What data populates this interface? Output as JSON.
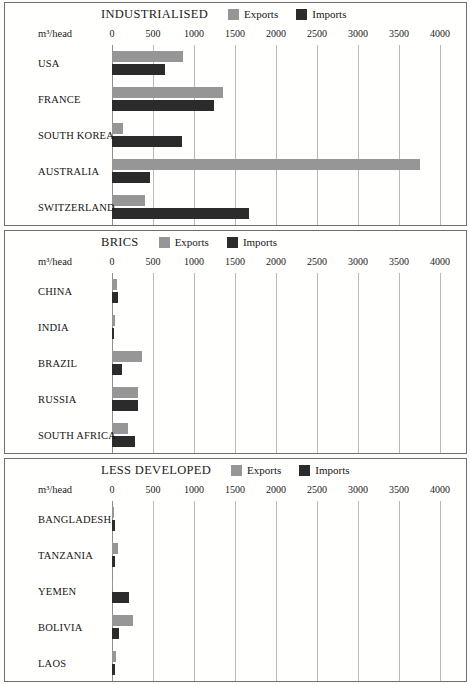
{
  "figure": {
    "unit_label": "m³/head",
    "axis_min": 0,
    "axis_max": 4000,
    "ticks": [
      0,
      500,
      1000,
      1500,
      2000,
      2500,
      3000,
      3500,
      4000
    ],
    "tick_labels": [
      "0",
      "500",
      "1000",
      "1500",
      "2000",
      "2500",
      "3000",
      "3500",
      "4000"
    ],
    "colors": {
      "exports": "#969696",
      "imports": "#2b2b2b",
      "gridline": "#b9b9b9",
      "panel_border": "#6f6f6f",
      "background": "#fffffe"
    },
    "legend": {
      "exports_label": "Exports",
      "imports_label": "Imports"
    }
  },
  "chart_data": [
    {
      "type": "bar",
      "title": "INDUSTRIALISED",
      "orientation": "horizontal",
      "xlabel": "m³/head",
      "ylabel": "",
      "xlim": [
        0,
        4000
      ],
      "grid": true,
      "legend_position": "top",
      "categories": [
        "USA",
        "FRANCE",
        "SOUTH KOREA",
        "AUSTRALIA",
        "SWITZERLAND"
      ],
      "series": [
        {
          "name": "Exports",
          "values": [
            865,
            1355,
            135,
            3755,
            400
          ]
        },
        {
          "name": "Imports",
          "values": [
            645,
            1245,
            855,
            465,
            1670
          ]
        }
      ]
    },
    {
      "type": "bar",
      "title": "BRICS",
      "orientation": "horizontal",
      "xlabel": "m³/head",
      "ylabel": "",
      "xlim": [
        0,
        4000
      ],
      "grid": true,
      "legend_position": "top",
      "categories": [
        "CHINA",
        "INDIA",
        "BRAZIL",
        "RUSSIA",
        "SOUTH AFRICA"
      ],
      "series": [
        {
          "name": "Exports",
          "values": [
            60,
            35,
            365,
            315,
            195
          ]
        },
        {
          "name": "Imports",
          "values": [
            75,
            25,
            120,
            315,
            280
          ]
        }
      ]
    },
    {
      "type": "bar",
      "title": "LESS DEVELOPED",
      "orientation": "horizontal",
      "xlabel": "m³/head",
      "ylabel": "",
      "xlim": [
        0,
        4000
      ],
      "grid": true,
      "legend_position": "top",
      "categories": [
        "BANGLADESH",
        "TANZANIA",
        "YEMEN",
        "BOLIVIA",
        "LAOS"
      ],
      "series": [
        {
          "name": "Exports",
          "values": [
            25,
            70,
            12,
            255,
            50
          ]
        },
        {
          "name": "Imports",
          "values": [
            35,
            35,
            205,
            85,
            35
          ]
        }
      ]
    }
  ]
}
